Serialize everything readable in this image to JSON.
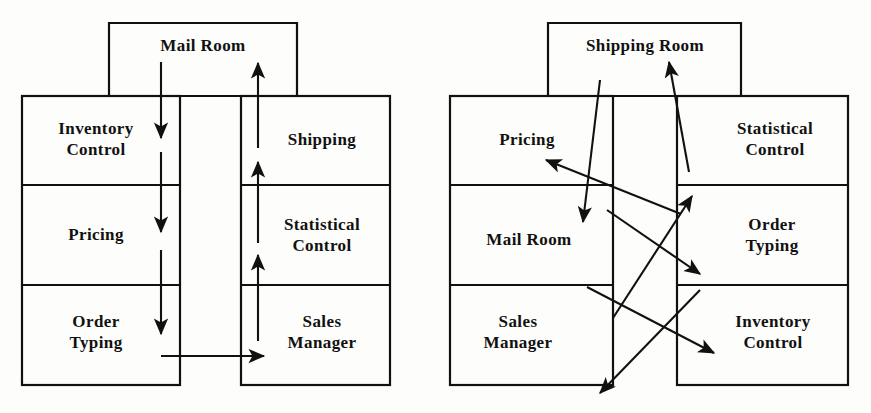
{
  "figure": {
    "background_color": "#fdfdfb",
    "ink_color": "#111111",
    "diagram_count": 2
  },
  "left_diagram": {
    "name": "existing-layout",
    "top_room": {
      "label": "Mail Room"
    },
    "left_column": [
      {
        "label_line1": "Inventory",
        "label_line2": "Control"
      },
      {
        "label_line1": "Pricing",
        "label_line2": ""
      },
      {
        "label_line1": "Order",
        "label_line2": "Typing"
      }
    ],
    "right_column": [
      {
        "label_line1": "Shipping",
        "label_line2": ""
      },
      {
        "label_line1": "Statistical",
        "label_line2": "Control"
      },
      {
        "label_line1": "Sales",
        "label_line2": "Manager"
      }
    ],
    "flow_description": "straight vertical down-flow on left side and up-flow on right side with one horizontal crossover at the bottom"
  },
  "right_diagram": {
    "name": "revised-layout",
    "top_room": {
      "label": "Shipping Room"
    },
    "left_column": [
      {
        "label_line1": "Pricing",
        "label_line2": ""
      },
      {
        "label_line1": "Mail Room",
        "label_line2": ""
      },
      {
        "label_line1": "Sales",
        "label_line2": "Manager"
      }
    ],
    "right_column": [
      {
        "label_line1": "Statistical",
        "label_line2": "Control"
      },
      {
        "label_line1": "Order",
        "label_line2": "Typing"
      },
      {
        "label_line1": "Inventory",
        "label_line2": "Control"
      }
    ],
    "flow_description": "crossing diagonal flow lines between left and right columns and up to the shipping room"
  }
}
